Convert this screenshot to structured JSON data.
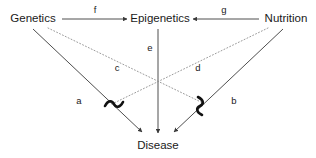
{
  "diagram": {
    "background_color": "#ffffff",
    "solid_edge_color": "#3a3a3a",
    "dotted_edge_color": "#8e8e8e",
    "text_color": "#1a1a1a",
    "squiggle_color": "#111111"
  },
  "nodes": [
    {
      "id": "genetics",
      "label": "Genetics",
      "x": 33,
      "y": 19
    },
    {
      "id": "epigenetics",
      "label": "Epigenetics",
      "x": 160,
      "y": 19
    },
    {
      "id": "nutrition",
      "label": "Nutrition",
      "x": 286,
      "y": 19
    },
    {
      "id": "disease",
      "label": "Disease",
      "x": 158,
      "y": 146
    }
  ],
  "edges": [
    {
      "id": "f",
      "label": "f",
      "from": "genetics",
      "to": "epigenetics",
      "style": "solid",
      "arrow": true,
      "label_x": 95,
      "label_y": 10
    },
    {
      "id": "g",
      "label": "g",
      "from": "nutrition",
      "to": "epigenetics",
      "style": "solid",
      "arrow": true,
      "label_x": 224,
      "label_y": 10
    },
    {
      "id": "e",
      "label": "e",
      "from": "epigenetics",
      "to": "disease",
      "style": "solid",
      "arrow": true,
      "label_x": 150,
      "label_y": 48
    },
    {
      "id": "a",
      "label": "a",
      "from": "genetics",
      "to": "disease",
      "style": "solid",
      "arrow": true,
      "label_x": 79,
      "label_y": 101
    },
    {
      "id": "b",
      "label": "b",
      "from": "nutrition",
      "to": "disease",
      "style": "solid",
      "arrow": true,
      "label_x": 234,
      "label_y": 101
    },
    {
      "id": "c",
      "label": "c",
      "from": "genetics",
      "to": "interaction-right",
      "style": "dotted",
      "arrow": false,
      "label_x": 117,
      "label_y": 68
    },
    {
      "id": "d",
      "label": "d",
      "from": "nutrition",
      "to": "interaction-left",
      "style": "dotted",
      "arrow": false,
      "label_x": 198,
      "label_y": 68
    }
  ],
  "interaction_markers": [
    {
      "id": "interaction-left",
      "symbol": "tilde",
      "x": 113,
      "y": 105
    },
    {
      "id": "interaction-right",
      "symbol": "tilde",
      "x": 200,
      "y": 105
    }
  ]
}
